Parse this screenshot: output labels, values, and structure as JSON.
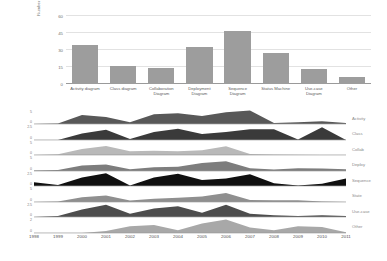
{
  "chart_data": [
    {
      "type": "bar",
      "title": "",
      "xlabel": "",
      "ylabel": "Number of Studies",
      "ylim": [
        0,
        60
      ],
      "yticks": [
        0,
        15,
        30,
        45,
        60
      ],
      "grid": true,
      "bar_color": "#9d9d9d",
      "categories": [
        "Activity diagram",
        "Class diagram",
        "Collaboration Diagram",
        "Deployment Diagram",
        "Sequence Diagram",
        "Status Machine",
        "Use-case Diagram",
        "Other"
      ],
      "values": [
        34,
        16,
        14,
        33,
        47,
        27,
        13,
        6
      ]
    },
    {
      "type": "area",
      "title": "",
      "xlabel": "",
      "ylabel": "",
      "grid": false,
      "legend_position": "right",
      "x": [
        1998,
        1999,
        2000,
        2001,
        2002,
        2003,
        2004,
        2005,
        2006,
        2007,
        2008,
        2009,
        2010,
        2011
      ],
      "xticks": [
        "1998",
        "1999",
        "2000",
        "2001",
        "2002",
        "2003",
        "2004",
        "2005",
        "2006",
        "2007",
        "2008",
        "2009",
        "2010",
        "2011"
      ],
      "series": [
        {
          "name": "Activity",
          "color": "#585858",
          "ylim": [
            0,
            5
          ],
          "yticks": [
            "5",
            "0"
          ],
          "values": [
            0,
            0.2,
            3.4,
            2.6,
            0.6,
            3.6,
            4.0,
            3.0,
            4.4,
            5.0,
            0.4,
            0.6,
            1.0,
            0.4
          ]
        },
        {
          "name": "Class",
          "color": "#3a3a3a",
          "ylim": [
            0,
            2.5
          ],
          "yticks": [
            "2.5",
            "0"
          ],
          "values": [
            0,
            0,
            1.2,
            1.9,
            0.2,
            1.5,
            2.1,
            1.1,
            1.5,
            2.0,
            2.0,
            0.1,
            2.4,
            0
          ]
        },
        {
          "name": "Collab",
          "color": "#b9b9b9",
          "ylim": [
            0,
            5
          ],
          "yticks": [
            "5",
            "0"
          ],
          "values": [
            0,
            0.3,
            2.2,
            3.4,
            1.4,
            1.6,
            1.4,
            1.8,
            3.3,
            0.4,
            0.2,
            0.1,
            0,
            0
          ]
        },
        {
          "name": "Deploy",
          "color": "#7d7d7d",
          "ylim": [
            0,
            5
          ],
          "yticks": [
            "5",
            "0"
          ],
          "values": [
            0.2,
            0.4,
            2.0,
            2.4,
            0.6,
            1.4,
            1.6,
            3.0,
            3.6,
            1.0,
            0.5,
            1.0,
            0.9,
            0.6
          ]
        },
        {
          "name": "Sequence",
          "color": "#101010",
          "ylim": [
            0,
            2.5
          ],
          "yticks": [
            "2.5",
            "0"
          ],
          "values": [
            0.7,
            0.2,
            1.6,
            2.4,
            0.1,
            1.6,
            2.3,
            1.1,
            1.4,
            2.2,
            0.5,
            0.1,
            0.4,
            1.4
          ]
        },
        {
          "name": "State",
          "color": "#8f8f8f",
          "ylim": [
            0,
            5
          ],
          "yticks": [
            "5",
            "0"
          ],
          "values": [
            0,
            0.2,
            1.8,
            2.4,
            0.5,
            1.2,
            1.6,
            2.0,
            3.4,
            0.7,
            0.6,
            0.6,
            0.2,
            0
          ]
        },
        {
          "name": "Use-case",
          "color": "#4d4d4d",
          "ylim": [
            0,
            2.5
          ],
          "yticks": [
            "2.5",
            "0"
          ],
          "values": [
            0,
            0.2,
            1.4,
            2.3,
            0.6,
            1.6,
            2.0,
            0.8,
            2.3,
            0.6,
            0.3,
            0.2,
            0.3,
            0.2
          ]
        },
        {
          "name": "Other",
          "color": "#a8a8a8",
          "ylim": [
            0,
            2
          ],
          "yticks": [
            "2",
            "0"
          ],
          "values": [
            0,
            0,
            0,
            0.3,
            1.0,
            1.2,
            0.4,
            1.4,
            2.0,
            0.8,
            0.4,
            1.0,
            0.9,
            0.1
          ]
        }
      ]
    }
  ]
}
